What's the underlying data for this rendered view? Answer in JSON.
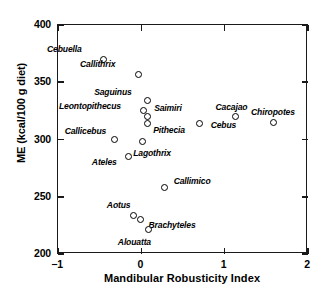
{
  "chart_data": {
    "type": "scatter",
    "title": "",
    "xlabel": "Mandibular Robusticity Index",
    "ylabel": "ME (kcal/100 g diet)",
    "xlim": [
      -1,
      2
    ],
    "ylim": [
      200,
      400
    ],
    "xticks": [
      "−1",
      "0",
      "1",
      "2"
    ],
    "xtick_values": [
      -1,
      0,
      1,
      2
    ],
    "yticks": [
      "200",
      "250",
      "300",
      "350",
      "400"
    ],
    "ytick_values": [
      200,
      250,
      300,
      350,
      400
    ],
    "grid": false,
    "legend": "none",
    "marker": "open-circle",
    "points": [
      {
        "label": "Cebuella",
        "x": -0.46,
        "y": 370,
        "lx": -56,
        "ly": -14
      },
      {
        "label": "Callithrix",
        "x": -0.04,
        "y": 357,
        "lx": -58,
        "ly": -14
      },
      {
        "label": "Saguinus",
        "x": 0.07,
        "y": 334,
        "lx": -53,
        "ly": -13
      },
      {
        "label": "Leontopithecus",
        "x": 0.02,
        "y": 325,
        "lx": -84,
        "ly": -9
      },
      {
        "label": "Saimiri",
        "x": 0.07,
        "y": 320,
        "lx": 7,
        "ly": -13
      },
      {
        "label": "Pithecia",
        "x": 0.07,
        "y": 314,
        "lx": 6,
        "ly": 3
      },
      {
        "label": "Callicebus",
        "x": -0.32,
        "y": 300,
        "lx": -50,
        "ly": -13
      },
      {
        "label": "Lagothrix",
        "x": 0.01,
        "y": 298,
        "lx": -9,
        "ly": 7
      },
      {
        "label": "Cebus",
        "x": 0.7,
        "y": 314,
        "lx": 11,
        "ly": -2
      },
      {
        "label": "Cacajao",
        "x": 1.13,
        "y": 320,
        "lx": -20,
        "ly": -14
      },
      {
        "label": "Chiropotes",
        "x": 1.58,
        "y": 315,
        "lx": -22,
        "ly": -14
      },
      {
        "label": "Ateles",
        "x": -0.15,
        "y": 285,
        "lx": -37,
        "ly": 1
      },
      {
        "label": "Callimico",
        "x": 0.28,
        "y": 258,
        "lx": 9,
        "ly": -11
      },
      {
        "label": "Aotus",
        "x": -0.09,
        "y": 234,
        "lx": -27,
        "ly": -14
      },
      {
        "label": "Brachyteles",
        "x": -0.01,
        "y": 230,
        "lx": 8,
        "ly": 1
      },
      {
        "label": "Alouatta",
        "x": 0.09,
        "y": 221,
        "lx": -31,
        "ly": 8
      }
    ]
  }
}
